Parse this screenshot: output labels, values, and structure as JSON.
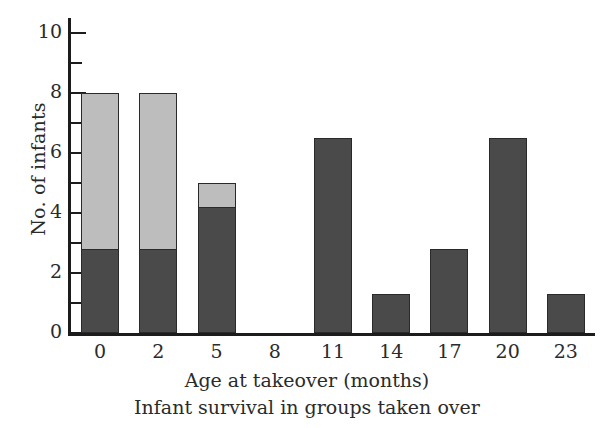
{
  "chart_data": {
    "type": "bar",
    "title": "Infant survival in groups taken over",
    "xlabel": "Age at takeover (months)",
    "ylabel": "No. of infants",
    "categories": [
      "0",
      "2",
      "5",
      "8",
      "11",
      "14",
      "17",
      "20",
      "23"
    ],
    "stacked": true,
    "series": [
      {
        "name": "survived",
        "color": "#4a4a4a",
        "values": [
          2.8,
          2.8,
          4.2,
          0,
          6.5,
          1.3,
          2.8,
          6.5,
          1.3
        ]
      },
      {
        "name": "died",
        "color": "#bdbdbd",
        "values": [
          5.2,
          5.2,
          0.8,
          0,
          0,
          0,
          0,
          0,
          0
        ]
      }
    ],
    "totals": [
      8,
      8,
      5,
      0,
      6.5,
      1.3,
      2.8,
      6.5,
      1.3
    ],
    "ylim": [
      0,
      10.5
    ],
    "ytick_major": [
      0,
      2,
      4,
      6,
      8,
      10
    ],
    "ytick_minor": [
      1,
      3,
      5,
      7,
      9
    ],
    "ytick_labels": [
      "0",
      "2",
      "4",
      "6",
      "8",
      "10"
    ],
    "grid": false,
    "legend": "none"
  },
  "axis": {
    "y_title": "No. of infants",
    "x_title": "Age at takeover (months)"
  },
  "caption": {
    "text": "Infant survival in groups taken over"
  },
  "colors": {
    "dark_segment": "#4a4a4a",
    "light_segment": "#bdbdbd",
    "axis": "#1c1c1c",
    "text": "#2b2b2b",
    "background": "#ffffff"
  }
}
